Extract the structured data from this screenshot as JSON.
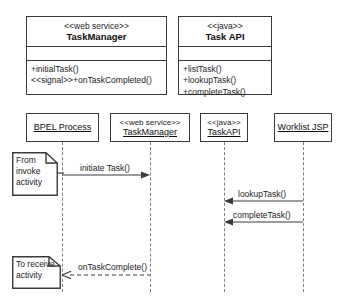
{
  "class_diagram": {
    "classes": [
      {
        "stereotype": "<<web service>>",
        "name": "TaskManager",
        "attributes": [],
        "operations": [
          "+initialTask()",
          "<<signal>>+onTaskCompleted()"
        ]
      },
      {
        "stereotype": "<<java>>",
        "name": "Task API",
        "attributes": [],
        "operations": [
          "+listTask()",
          "+lookupTask()",
          "+completeTask()"
        ]
      }
    ]
  },
  "sequence_diagram": {
    "lifelines": [
      {
        "stereotype": "",
        "name": "BPEL Process"
      },
      {
        "stereotype": "<<web service>>",
        "name": "TaskManager"
      },
      {
        "stereotype": "<<java>>",
        "name": "TaskAPI"
      },
      {
        "stereotype": "",
        "name": "Worklist JSP"
      }
    ],
    "notes": [
      {
        "text": "From invoke activity",
        "line1": "From",
        "line2": "invoke",
        "line3": "activity"
      },
      {
        "text": "To receive activity",
        "line1": "To receive",
        "line2": "activity",
        "line3": ""
      }
    ],
    "messages": [
      {
        "label": "initiate Task()",
        "from": "BPEL Process",
        "to": "TaskManager",
        "style": "solid",
        "direction": "right"
      },
      {
        "label": "lookupTask()",
        "from": "Worklist JSP",
        "to": "TaskAPI",
        "style": "solid",
        "direction": "left"
      },
      {
        "label": "completeTask()",
        "from": "Worklist JSP",
        "to": "TaskAPI",
        "style": "solid",
        "direction": "left"
      },
      {
        "label": "onTaskComplete()",
        "from": "TaskManager",
        "to": "BPEL Process",
        "style": "dashed",
        "direction": "left"
      }
    ]
  },
  "colors": {
    "stroke": "#3a3a3a",
    "lifeline": "#7d7d89",
    "text": "#1c1c1c",
    "background": "#ffffff"
  }
}
